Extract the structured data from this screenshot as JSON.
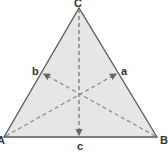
{
  "diagram": {
    "type": "triangle-medians",
    "colors": {
      "fill": "#e6e6e6",
      "stroke": "#555555",
      "dash": "#777777",
      "label": "#333333"
    },
    "vertices": {
      "A": {
        "label": "A",
        "x": 4,
        "y": 137
      },
      "B": {
        "label": "B",
        "x": 157,
        "y": 137
      },
      "C": {
        "label": "C",
        "x": 79,
        "y": 8
      }
    },
    "midpoints": {
      "a": {
        "label": "a",
        "x": 118,
        "y": 73
      },
      "b": {
        "label": "b",
        "x": 42,
        "y": 73
      },
      "c": {
        "label": "c",
        "x": 80,
        "y": 137
      }
    },
    "labels": {
      "A": "A",
      "B": "B",
      "C": "C",
      "a": "a",
      "b": "b",
      "c": "c"
    }
  }
}
